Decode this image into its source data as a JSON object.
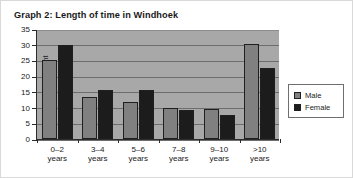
{
  "figure": {
    "title": "Graph 2: Length of time in Windhoek"
  },
  "legend": {
    "position": "right",
    "entries": [
      {
        "label": "Male",
        "color": "#808080",
        "swatch_name": "legend-swatch-male"
      },
      {
        "label": "Female",
        "color": "#1c1c1c",
        "swatch_name": "legend-swatch-female"
      }
    ]
  },
  "axes": {
    "y_title": "Percent",
    "y_ticks": [
      "0",
      "5",
      "10",
      "15",
      "20",
      "25",
      "30",
      "35"
    ],
    "x_labels": [
      "0–2\nyears",
      "3–4\nyears",
      "5–6\nyears",
      "7–8\nyears",
      "9–10\nyears",
      ">10 years"
    ]
  },
  "chart_data": {
    "type": "bar",
    "title": "Graph 2: Length of time in Windhoek",
    "xlabel": "",
    "ylabel": "Percent",
    "ylim": [
      0,
      35
    ],
    "ytick_step": 5,
    "grid": true,
    "legend_position": "right",
    "categories": [
      "0–2 years",
      "3–4 years",
      "5–6 years",
      "7–8 years",
      "9–10 years",
      ">10 years"
    ],
    "series": [
      {
        "name": "Male",
        "color": "#808080",
        "values": [
          25.0,
          13.5,
          11.8,
          10.0,
          9.7,
          30.2
        ]
      },
      {
        "name": "Female",
        "color": "#1c1c1c",
        "values": [
          30.0,
          15.5,
          15.5,
          9.3,
          7.5,
          22.5
        ]
      }
    ]
  }
}
